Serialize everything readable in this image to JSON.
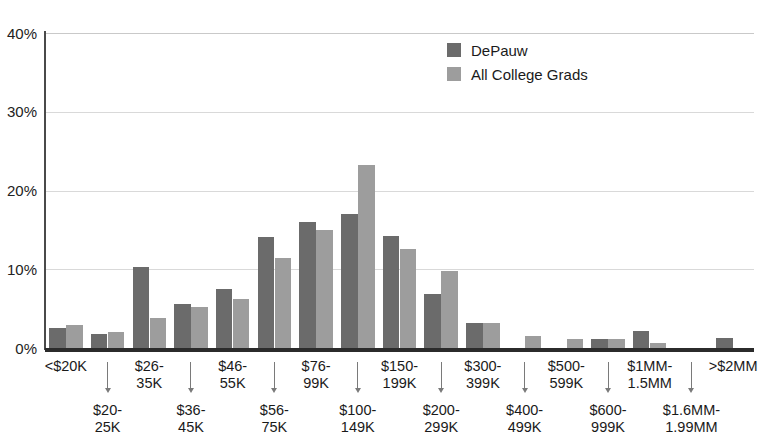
{
  "chart_data": {
    "type": "bar",
    "title": "",
    "subtitle": "",
    "xlabel": "",
    "ylabel": "",
    "ylim": [
      0,
      40
    ],
    "y_ticks": [
      "0%",
      "10%",
      "20%",
      "30%",
      "40%"
    ],
    "y_tick_values": [
      0,
      10,
      20,
      30,
      40
    ],
    "grid": true,
    "legend_position": "top-right",
    "categories": [
      "<$20K",
      "$20-25K",
      "$26-35K",
      "$36-45K",
      "$46-55K",
      "$56-75K",
      "$76-99K",
      "$100-149K",
      "$150-199K",
      "$200-299K",
      "$300-399K",
      "$400-499K",
      "$500-599K",
      "$600-999K",
      "$1MM-1.5MM",
      "$1.6MM-1.99MM",
      ">$2MM"
    ],
    "series": [
      {
        "name": "DePauw",
        "color": "#6b6b6b",
        "values": [
          2.6,
          1.8,
          10.3,
          5.6,
          7.5,
          14.1,
          16.0,
          17.0,
          14.2,
          6.8,
          3.2,
          0.0,
          0.0,
          1.1,
          2.2,
          0.0,
          1.3
        ]
      },
      {
        "name": "All College Grads",
        "color": "#9d9d9d",
        "values": [
          2.9,
          2.0,
          3.8,
          5.2,
          6.2,
          11.4,
          15.0,
          23.3,
          12.6,
          9.8,
          3.2,
          1.5,
          1.2,
          1.2,
          0.7,
          0.0,
          0.0
        ]
      }
    ]
  },
  "legend": {
    "items": [
      {
        "label": "DePauw",
        "color": "#6b6b6b"
      },
      {
        "label": "All College Grads",
        "color": "#9d9d9d"
      }
    ]
  },
  "axis": {
    "y_ticks": [
      {
        "label": "40%",
        "value": 40
      },
      {
        "label": "30%",
        "value": 30
      },
      {
        "label": "20%",
        "value": 20
      },
      {
        "label": "10%",
        "value": 10
      },
      {
        "label": "0%",
        "value": 0
      }
    ],
    "x_labels_top": [
      "<$20K",
      "$26-",
      "35K",
      "$46-",
      "55K",
      "$76-",
      "99K",
      "$150-",
      "199K",
      "$300-",
      "399K",
      "$500-",
      "599K",
      "$1MM-",
      "1.5MM",
      ">$2MM"
    ],
    "x_labels_row_top": [
      {
        "line1": "<$20K",
        "line2": ""
      },
      {
        "line1": "$26-",
        "line2": "35K"
      },
      {
        "line1": "$46-",
        "line2": "55K"
      },
      {
        "line1": "$76-",
        "line2": "99K"
      },
      {
        "line1": "$150-",
        "line2": "199K"
      },
      {
        "line1": "$300-",
        "line2": "399K"
      },
      {
        "line1": "$500-",
        "line2": "599K"
      },
      {
        "line1": "$1MM-",
        "line2": "1.5MM"
      },
      {
        "line1": ">$2MM",
        "line2": ""
      }
    ],
    "x_labels_row_bottom": [
      {
        "line1": "$20-",
        "line2": "25K"
      },
      {
        "line1": "$36-",
        "line2": "45K"
      },
      {
        "line1": "$56-",
        "line2": "75K"
      },
      {
        "line1": "$100-",
        "line2": "149K"
      },
      {
        "line1": "$200-",
        "line2": "299K"
      },
      {
        "line1": "$400-",
        "line2": "499K"
      },
      {
        "line1": "$600-",
        "line2": "999K"
      },
      {
        "line1": "$1.6MM-",
        "line2": "1.99MM"
      }
    ]
  },
  "colors": {
    "series_primary": "#6b6b6b",
    "series_secondary": "#9d9d9d",
    "gridline": "#d9d9d9",
    "axis": "#2b2b2b",
    "text": "#1a1a1a"
  }
}
